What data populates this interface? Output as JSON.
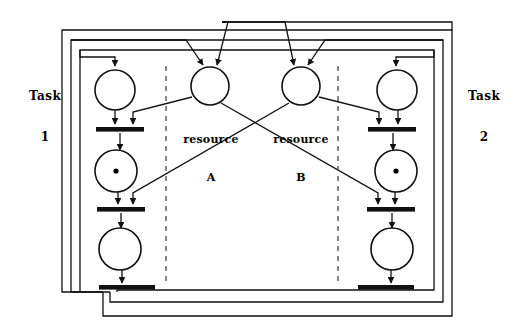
{
  "diagram": {
    "type": "petri-net",
    "canvas": {
      "width": 515,
      "height": 328
    },
    "colors": {
      "stroke": "#111111",
      "background": "#ffffff",
      "dashed": "#555555",
      "token": "#000000"
    }
  },
  "labels": {
    "task1_line1": "Task",
    "task1_line2": "1",
    "task2_line1": "Task",
    "task2_line2": "2",
    "resourceA_line1": "resource",
    "resourceA_line2": "A",
    "resourceB_line1": "resource",
    "resourceB_line2": "B"
  },
  "places": [
    {
      "id": "t1-p1",
      "name": "task1-place-idle",
      "cx": 115,
      "cy": 90,
      "r": 20,
      "tokens": 0
    },
    {
      "id": "t1-p2",
      "name": "task1-place-holding-A",
      "cx": 115,
      "cy": 172,
      "r": 20,
      "tokens": 1
    },
    {
      "id": "t1-p3",
      "name": "task1-place-holding-AB",
      "cx": 115,
      "cy": 250,
      "r": 20,
      "tokens": 0
    },
    {
      "id": "resA",
      "name": "resource-a-place",
      "cx": 210,
      "cy": 87,
      "r": 19,
      "tokens": 0
    },
    {
      "id": "resB",
      "name": "resource-b-place",
      "cx": 301,
      "cy": 87,
      "r": 19,
      "tokens": 0
    },
    {
      "id": "t2-p1",
      "name": "task2-place-idle",
      "cx": 396,
      "cy": 90,
      "r": 20,
      "tokens": 0
    },
    {
      "id": "t2-p2",
      "name": "task2-place-holding-B",
      "cx": 396,
      "cy": 172,
      "r": 20,
      "tokens": 1
    },
    {
      "id": "t2-p3",
      "name": "task2-place-holding-BA",
      "cx": 396,
      "cy": 250,
      "r": 20,
      "tokens": 0
    }
  ],
  "transitions": [
    {
      "id": "t1-tr1",
      "name": "task1-transition-acquire-A",
      "cx": 120,
      "cy": 130,
      "w": 48,
      "h": 5
    },
    {
      "id": "t1-tr2",
      "name": "task1-transition-acquire-B",
      "cx": 120,
      "cy": 210,
      "w": 48,
      "h": 5
    },
    {
      "id": "t1-tr3",
      "name": "task1-transition-release",
      "cx": 123,
      "cy": 288,
      "w": 48,
      "h": 5
    },
    {
      "id": "t2-tr1",
      "name": "task2-transition-acquire-B",
      "cx": 391,
      "cy": 130,
      "w": 48,
      "h": 5
    },
    {
      "id": "t2-tr2",
      "name": "task2-transition-acquire-A",
      "cx": 391,
      "cy": 210,
      "w": 48,
      "h": 5
    },
    {
      "id": "t2-tr3",
      "name": "task2-transition-release",
      "cx": 388,
      "cy": 288,
      "w": 48,
      "h": 5
    }
  ],
  "dividers": [
    {
      "name": "left-dashed-divider",
      "x": 166,
      "y1": 66,
      "y2": 282
    },
    {
      "name": "right-dashed-divider",
      "x": 338,
      "y1": 66,
      "y2": 282
    }
  ],
  "enclosures": [
    {
      "name": "outer-feedback-rectangle",
      "x": 62,
      "y": 30,
      "w": 390,
      "h": 286
    },
    {
      "name": "middle-feedback-rectangle",
      "x": 71,
      "y": 40,
      "w": 372,
      "h": 262
    },
    {
      "name": "inner-feedback-rectangle",
      "x": 80,
      "y": 50,
      "w": 354,
      "h": 240
    }
  ],
  "arc_count": 22
}
